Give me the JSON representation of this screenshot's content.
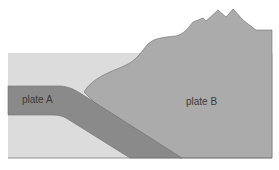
{
  "diagram": {
    "title": "",
    "labels": {
      "plate_a": "plate A",
      "plate_b": "plate B"
    },
    "colors": {
      "background": "#ffffff",
      "ocean_mantle": "#dcdcdc",
      "plate_a": "#8a8a8a",
      "plate_b": "#ababab",
      "outline": "#6e6e6e"
    }
  }
}
